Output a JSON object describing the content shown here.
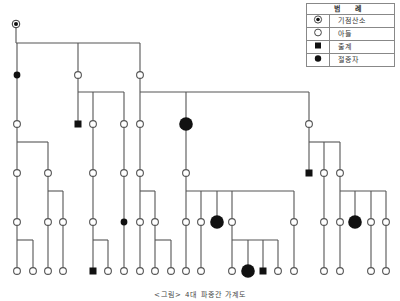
{
  "legend": {
    "title": "범    례",
    "items": [
      {
        "symbol": "bullseye",
        "label": "기점산소"
      },
      {
        "symbol": "open-circle",
        "label": "아들"
      },
      {
        "symbol": "filled-square",
        "label": "출계"
      },
      {
        "symbol": "filled-circle",
        "label": "절종자"
      }
    ]
  },
  "caption": "<그림> 4대 파종간 가계도",
  "colors": {
    "line": "#555555",
    "fill": "#111111",
    "node_stroke": "#555555"
  },
  "tree": {
    "nodes": [
      {
        "id": "root",
        "x": 16,
        "y": 24,
        "type": "bullseye"
      },
      {
        "id": "g1a",
        "x": 17,
        "y": 75,
        "type": "small-filled"
      },
      {
        "id": "g1b",
        "x": 78,
        "y": 75,
        "type": "open"
      },
      {
        "id": "g1c",
        "x": 140,
        "y": 75,
        "type": "open"
      },
      {
        "id": "g2a",
        "x": 17,
        "y": 124,
        "type": "open"
      },
      {
        "id": "g2b",
        "x": 78,
        "y": 124,
        "type": "square"
      },
      {
        "id": "g2c",
        "x": 93,
        "y": 124,
        "type": "open"
      },
      {
        "id": "g2d",
        "x": 124,
        "y": 124,
        "type": "open"
      },
      {
        "id": "g2e",
        "x": 140,
        "y": 124,
        "type": "open"
      },
      {
        "id": "g2f",
        "x": 186,
        "y": 124,
        "type": "big-filled"
      },
      {
        "id": "g2g",
        "x": 309,
        "y": 124,
        "type": "open"
      },
      {
        "id": "g3a",
        "x": 17,
        "y": 173,
        "type": "open"
      },
      {
        "id": "g3b",
        "x": 48,
        "y": 173,
        "type": "open"
      },
      {
        "id": "g3c",
        "x": 93,
        "y": 173,
        "type": "open"
      },
      {
        "id": "g3d",
        "x": 124,
        "y": 173,
        "type": "open"
      },
      {
        "id": "g3e",
        "x": 140,
        "y": 173,
        "type": "open"
      },
      {
        "id": "g3f",
        "x": 186,
        "y": 173,
        "type": "open"
      },
      {
        "id": "g3g",
        "x": 309,
        "y": 173,
        "type": "square"
      },
      {
        "id": "g3h",
        "x": 324,
        "y": 173,
        "type": "open"
      },
      {
        "id": "g3i",
        "x": 340,
        "y": 173,
        "type": "open"
      },
      {
        "id": "g4a",
        "x": 17,
        "y": 222,
        "type": "open"
      },
      {
        "id": "g4b",
        "x": 48,
        "y": 222,
        "type": "open"
      },
      {
        "id": "g4c",
        "x": 63,
        "y": 222,
        "type": "open"
      },
      {
        "id": "g4d",
        "x": 93,
        "y": 222,
        "type": "open"
      },
      {
        "id": "g4e",
        "x": 124,
        "y": 222,
        "type": "small-filled"
      },
      {
        "id": "g4f",
        "x": 140,
        "y": 222,
        "type": "open"
      },
      {
        "id": "g4g",
        "x": 155,
        "y": 222,
        "type": "open"
      },
      {
        "id": "g4h",
        "x": 186,
        "y": 222,
        "type": "open"
      },
      {
        "id": "g4i",
        "x": 201,
        "y": 222,
        "type": "open"
      },
      {
        "id": "g4j",
        "x": 217,
        "y": 222,
        "type": "big-filled"
      },
      {
        "id": "g4k",
        "x": 232,
        "y": 222,
        "type": "open"
      },
      {
        "id": "g4l",
        "x": 294,
        "y": 222,
        "type": "open"
      },
      {
        "id": "g4m",
        "x": 324,
        "y": 222,
        "type": "open"
      },
      {
        "id": "g4n",
        "x": 340,
        "y": 222,
        "type": "open"
      },
      {
        "id": "g4o",
        "x": 355,
        "y": 222,
        "type": "big-filled"
      },
      {
        "id": "g4p",
        "x": 371,
        "y": 222,
        "type": "open"
      },
      {
        "id": "g4q",
        "x": 386,
        "y": 222,
        "type": "open"
      },
      {
        "id": "g5a",
        "x": 17,
        "y": 271,
        "type": "open"
      },
      {
        "id": "g5b",
        "x": 33,
        "y": 271,
        "type": "open"
      },
      {
        "id": "g5c",
        "x": 48,
        "y": 271,
        "type": "open"
      },
      {
        "id": "g5d",
        "x": 63,
        "y": 271,
        "type": "open"
      },
      {
        "id": "g5e",
        "x": 93,
        "y": 271,
        "type": "square"
      },
      {
        "id": "g5f",
        "x": 108,
        "y": 271,
        "type": "open"
      },
      {
        "id": "g5g",
        "x": 124,
        "y": 271,
        "type": "open"
      },
      {
        "id": "g5h",
        "x": 140,
        "y": 271,
        "type": "open"
      },
      {
        "id": "g5i",
        "x": 155,
        "y": 271,
        "type": "open"
      },
      {
        "id": "g5j",
        "x": 171,
        "y": 271,
        "type": "open"
      },
      {
        "id": "g5k",
        "x": 186,
        "y": 271,
        "type": "open"
      },
      {
        "id": "g5l",
        "x": 201,
        "y": 271,
        "type": "open"
      },
      {
        "id": "g5m",
        "x": 232,
        "y": 271,
        "type": "open"
      },
      {
        "id": "g5n",
        "x": 248,
        "y": 271,
        "type": "big-filled"
      },
      {
        "id": "g5o",
        "x": 263,
        "y": 271,
        "type": "square"
      },
      {
        "id": "g5p",
        "x": 278,
        "y": 271,
        "type": "open"
      },
      {
        "id": "g5q",
        "x": 294,
        "y": 271,
        "type": "open"
      },
      {
        "id": "g5r",
        "x": 324,
        "y": 271,
        "type": "open"
      },
      {
        "id": "g5s",
        "x": 340,
        "y": 271,
        "type": "open"
      },
      {
        "id": "g5t",
        "x": 371,
        "y": 271,
        "type": "open"
      },
      {
        "id": "g5u",
        "x": 386,
        "y": 271,
        "type": "open"
      }
    ],
    "families": [
      {
        "parent": "root",
        "bar_y": 43,
        "children": [
          "g1a",
          "g1b",
          "g1c"
        ]
      },
      {
        "parent": "g1a",
        "bar_y": null,
        "children": [
          "g2a"
        ]
      },
      {
        "parent": "g1b",
        "bar_y": 92,
        "children": [
          "g2b",
          "g2c",
          "g2d"
        ]
      },
      {
        "parent": "g1c",
        "bar_y": 92,
        "children": [
          "g2e",
          "g2f",
          "g2g"
        ]
      },
      {
        "parent": "g2a",
        "bar_y": 142,
        "children": [
          "g3a",
          "g3b"
        ]
      },
      {
        "parent": "g2c",
        "bar_y": null,
        "children": [
          "g3c"
        ]
      },
      {
        "parent": "g2d",
        "bar_y": null,
        "children": [
          "g3d"
        ]
      },
      {
        "parent": "g2e",
        "bar_y": null,
        "children": [
          "g3e"
        ]
      },
      {
        "parent": "g2f",
        "bar_y": null,
        "children": [
          "g3f"
        ]
      },
      {
        "parent": "g2g",
        "bar_y": 142,
        "children": [
          "g3g",
          "g3h",
          "g3i"
        ]
      },
      {
        "parent": "g3a",
        "bar_y": null,
        "children": [
          "g4a"
        ]
      },
      {
        "parent": "g3b",
        "bar_y": 191,
        "children": [
          "g4b",
          "g4c"
        ]
      },
      {
        "parent": "g3c",
        "bar_y": null,
        "children": [
          "g4d"
        ]
      },
      {
        "parent": "g3d",
        "bar_y": null,
        "children": [
          "g4e"
        ]
      },
      {
        "parent": "g3e",
        "bar_y": 191,
        "children": [
          "g4f",
          "g4g"
        ]
      },
      {
        "parent": "g3f",
        "bar_y": 191,
        "children": [
          "g4h",
          "g4i",
          "g4j",
          "g4k",
          "g4l"
        ]
      },
      {
        "parent": "g3h",
        "bar_y": null,
        "children": [
          "g4m"
        ]
      },
      {
        "parent": "g3i",
        "bar_y": 191,
        "children": [
          "g4n",
          "g4o",
          "g4p",
          "g4q"
        ]
      },
      {
        "parent": "g4a",
        "bar_y": 240,
        "children": [
          "g5a",
          "g5b"
        ]
      },
      {
        "parent": "g4b",
        "bar_y": null,
        "children": [
          "g5c"
        ]
      },
      {
        "parent": "g4c",
        "bar_y": null,
        "children": [
          "g5d"
        ]
      },
      {
        "parent": "g4d",
        "bar_y": 240,
        "children": [
          "g5e",
          "g5f"
        ]
      },
      {
        "parent": "g4e",
        "bar_y": null,
        "children": [
          "g5g"
        ]
      },
      {
        "parent": "g4f",
        "bar_y": null,
        "children": [
          "g5h"
        ]
      },
      {
        "parent": "g4g",
        "bar_y": 240,
        "children": [
          "g5i",
          "g5j"
        ]
      },
      {
        "parent": "g4h",
        "bar_y": null,
        "children": [
          "g5k"
        ]
      },
      {
        "parent": "g4i",
        "bar_y": null,
        "children": [
          "g5l"
        ]
      },
      {
        "parent": "g4k",
        "bar_y": 240,
        "children": [
          "g5m",
          "g5n",
          "g5o",
          "g5p"
        ]
      },
      {
        "parent": "g4l",
        "bar_y": null,
        "children": [
          "g5q"
        ]
      },
      {
        "parent": "g4m",
        "bar_y": null,
        "children": [
          "g5r"
        ]
      },
      {
        "parent": "g4n",
        "bar_y": null,
        "children": [
          "g5s"
        ]
      },
      {
        "parent": "g4p",
        "bar_y": null,
        "children": [
          "g5t"
        ]
      },
      {
        "parent": "g4q",
        "bar_y": null,
        "children": [
          "g5u"
        ]
      }
    ]
  }
}
